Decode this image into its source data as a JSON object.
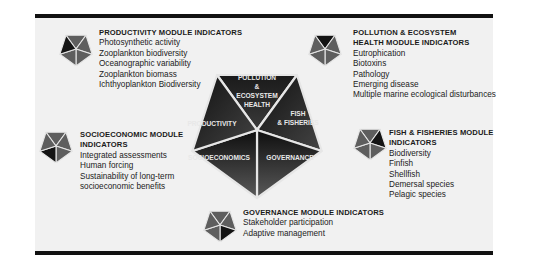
{
  "center": {
    "segments": [
      {
        "id": "pollution",
        "label_lines": [
          "POLLUTION",
          "&",
          "ECOSYSTEM",
          "HEALTH"
        ]
      },
      {
        "id": "fish",
        "label_lines": [
          "FISH",
          "& FISHERIES"
        ]
      },
      {
        "id": "governance",
        "label_lines": [
          "GOVERNANCE"
        ]
      },
      {
        "id": "socioeconomics",
        "label_lines": [
          "SOCIOECONOMICS"
        ]
      },
      {
        "id": "productivity",
        "label_lines": [
          "PRODUCTIVITY"
        ]
      }
    ]
  },
  "modules": {
    "productivity": {
      "title_lines": [
        "PRODUCTIVITY MODULE INDICATORS"
      ],
      "items": [
        "Photosynthetic activity",
        "Zooplankton biodiversity",
        "Oceanographic variability",
        "Zooplankton biomass",
        "Ichthyoplankton Biodiversity"
      ]
    },
    "pollution": {
      "title_lines": [
        "POLLUTION & ECOSYSTEM",
        "HEALTH MODULE INDICATORS"
      ],
      "items": [
        "Eutrophication",
        "Biotoxins",
        "Pathology",
        "Emerging disease",
        "Multiple marine ecological disturbances"
      ]
    },
    "socioeconomic": {
      "title_lines": [
        "SOCIOECONOMIC MODULE",
        "INDICATORS"
      ],
      "items": [
        "Integrated assessments",
        "Human forcing",
        "Sustainability of long-term",
        "socioeconomic benefits"
      ]
    },
    "fish": {
      "title_lines": [
        "FISH & FISHERIES MODULE",
        "INDICATORS"
      ],
      "items": [
        "Biodiversity",
        "Finfish",
        "Shellfish",
        "Demersal species",
        "Pelagic species"
      ]
    },
    "governance": {
      "title_lines": [
        "GOVERNANCE MODULE INDICATORS"
      ],
      "items": [
        "Stakeholder participation",
        "Adaptive management"
      ]
    }
  },
  "colors": {
    "dark": "#141414",
    "mid": "#5e5e5e",
    "divider": "#e6e6e6",
    "background": "#f1f1f1"
  }
}
